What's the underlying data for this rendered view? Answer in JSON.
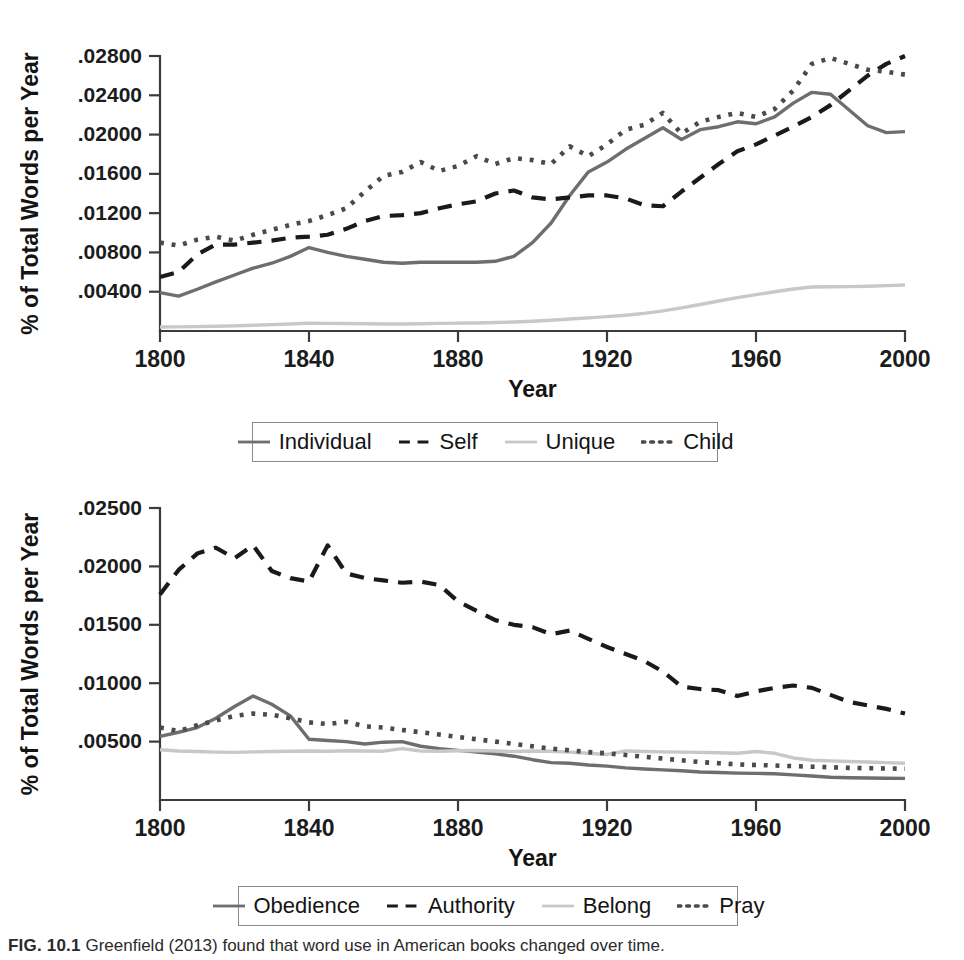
{
  "figure": {
    "caption_label": "FIG. 10.1",
    "caption_text": "Greenfield (2013) found that word use in American books changed over time."
  },
  "colors": {
    "solid_dark_gray": "#6e6e6e",
    "dashed_black": "#1a1a1a",
    "light_gray": "#c8c8c8",
    "dotted_dark": "#4a4a4a",
    "axis": "#3c3c3c"
  },
  "chart_data": [
    {
      "type": "line",
      "title": "",
      "xlabel": "Year",
      "ylabel": "% of Total Words per Year",
      "xlim": [
        1800,
        2000
      ],
      "ylim": [
        0,
        0.028
      ],
      "xticks": [
        1800,
        1840,
        1880,
        1920,
        1960,
        2000
      ],
      "xticklabels": [
        "1800",
        "1840",
        "1880",
        "1920",
        "1960",
        "2000"
      ],
      "yticks": [
        0.004,
        0.008,
        0.012,
        0.016,
        0.02,
        0.024,
        0.028
      ],
      "yticklabels": [
        ".00400",
        ".00800",
        ".01200",
        ".01600",
        ".02000",
        ".02400",
        ".02800"
      ],
      "grid": false,
      "legend_position": "below",
      "x": [
        1800,
        1805,
        1810,
        1815,
        1820,
        1825,
        1830,
        1835,
        1840,
        1845,
        1850,
        1855,
        1860,
        1865,
        1870,
        1875,
        1880,
        1885,
        1890,
        1895,
        1900,
        1905,
        1910,
        1915,
        1920,
        1925,
        1930,
        1935,
        1940,
        1945,
        1950,
        1955,
        1960,
        1965,
        1970,
        1975,
        1980,
        1985,
        1990,
        1995,
        2000
      ],
      "series": [
        {
          "name": "Individual",
          "style": "solid",
          "color": "#6e6e6e",
          "values": [
            0.0039,
            0.00355,
            0.00425,
            0.005,
            0.0057,
            0.0064,
            0.0069,
            0.0076,
            0.0085,
            0.008,
            0.0076,
            0.0073,
            0.007,
            0.0069,
            0.007,
            0.007,
            0.007,
            0.007,
            0.0071,
            0.0076,
            0.009,
            0.011,
            0.0138,
            0.0162,
            0.0172,
            0.0185,
            0.0196,
            0.0207,
            0.0195,
            0.0205,
            0.0208,
            0.0213,
            0.0211,
            0.0218,
            0.0232,
            0.0243,
            0.0241,
            0.0225,
            0.0209,
            0.0202,
            0.0203
          ]
        },
        {
          "name": "Self",
          "style": "dashed",
          "color": "#1a1a1a",
          "values": [
            0.0055,
            0.006,
            0.0078,
            0.0088,
            0.0088,
            0.009,
            0.0092,
            0.0095,
            0.0096,
            0.0098,
            0.0104,
            0.0112,
            0.0117,
            0.0118,
            0.012,
            0.0125,
            0.0129,
            0.0132,
            0.014,
            0.0143,
            0.0136,
            0.0134,
            0.0136,
            0.0138,
            0.0138,
            0.0135,
            0.0128,
            0.0127,
            0.0142,
            0.0156,
            0.017,
            0.0183,
            0.019,
            0.0199,
            0.0208,
            0.0218,
            0.023,
            0.0245,
            0.026,
            0.0272,
            0.028
          ]
        },
        {
          "name": "Unique",
          "style": "solid",
          "color": "#c8c8c8",
          "values": [
            0.0004,
            0.00042,
            0.00045,
            0.00048,
            0.00052,
            0.00058,
            0.00065,
            0.00072,
            0.0008,
            0.00078,
            0.00076,
            0.00074,
            0.00072,
            0.00072,
            0.00074,
            0.00078,
            0.0008,
            0.00082,
            0.00086,
            0.00092,
            0.001,
            0.0011,
            0.00122,
            0.00134,
            0.00146,
            0.0016,
            0.0018,
            0.00205,
            0.00235,
            0.0027,
            0.00305,
            0.0034,
            0.0037,
            0.004,
            0.00428,
            0.00448,
            0.0045,
            0.00452,
            0.00456,
            0.00462,
            0.00468
          ]
        },
        {
          "name": "Child",
          "style": "dotted",
          "color": "#4a4a4a",
          "values": [
            0.009,
            0.0087,
            0.0093,
            0.0096,
            0.0092,
            0.0098,
            0.0103,
            0.0108,
            0.0112,
            0.0118,
            0.0125,
            0.0142,
            0.0158,
            0.0162,
            0.0172,
            0.0163,
            0.0168,
            0.0178,
            0.017,
            0.0176,
            0.0174,
            0.017,
            0.0188,
            0.0178,
            0.019,
            0.0205,
            0.021,
            0.0222,
            0.0201,
            0.0213,
            0.0218,
            0.0222,
            0.0218,
            0.0226,
            0.0245,
            0.0272,
            0.0278,
            0.0272,
            0.0266,
            0.0264,
            0.0261
          ]
        }
      ]
    },
    {
      "type": "line",
      "title": "",
      "xlabel": "Year",
      "ylabel": "% of Total Words per Year",
      "xlim": [
        1800,
        2000
      ],
      "ylim": [
        0,
        0.025
      ],
      "xticks": [
        1800,
        1840,
        1880,
        1920,
        1960,
        2000
      ],
      "xticklabels": [
        "1800",
        "1840",
        "1880",
        "1920",
        "1960",
        "2000"
      ],
      "yticks": [
        0.005,
        0.01,
        0.015,
        0.02,
        0.025
      ],
      "yticklabels": [
        ".00500",
        ".01000",
        ".01500",
        ".02000",
        ".02500"
      ],
      "grid": false,
      "legend_position": "below",
      "x": [
        1800,
        1805,
        1810,
        1815,
        1820,
        1825,
        1830,
        1835,
        1840,
        1845,
        1850,
        1855,
        1860,
        1865,
        1870,
        1875,
        1880,
        1885,
        1890,
        1895,
        1900,
        1905,
        1910,
        1915,
        1920,
        1925,
        1930,
        1935,
        1940,
        1945,
        1950,
        1955,
        1960,
        1965,
        1970,
        1975,
        1980,
        1985,
        1990,
        1995,
        2000
      ],
      "series": [
        {
          "name": "Obedience",
          "style": "solid",
          "color": "#6e6e6e",
          "values": [
            0.00545,
            0.0058,
            0.0062,
            0.007,
            0.008,
            0.0089,
            0.0082,
            0.0072,
            0.0052,
            0.0051,
            0.005,
            0.0048,
            0.00495,
            0.005,
            0.0046,
            0.0044,
            0.00425,
            0.0041,
            0.00395,
            0.00375,
            0.00345,
            0.0032,
            0.00315,
            0.003,
            0.0029,
            0.00275,
            0.00265,
            0.00258,
            0.0025,
            0.0024,
            0.00235,
            0.0023,
            0.00228,
            0.00225,
            0.00215,
            0.00205,
            0.00195,
            0.0019,
            0.00188,
            0.00186,
            0.00185
          ]
        },
        {
          "name": "Authority",
          "style": "dashed",
          "color": "#1a1a1a",
          "values": [
            0.0176,
            0.0197,
            0.0211,
            0.0216,
            0.0207,
            0.0218,
            0.0196,
            0.019,
            0.0187,
            0.0218,
            0.0194,
            0.019,
            0.0188,
            0.0186,
            0.0187,
            0.0184,
            0.017,
            0.0162,
            0.0154,
            0.015,
            0.0148,
            0.0142,
            0.0145,
            0.0138,
            0.0131,
            0.0125,
            0.0119,
            0.011,
            0.0097,
            0.0095,
            0.0094,
            0.0089,
            0.0093,
            0.0096,
            0.0098,
            0.0096,
            0.009,
            0.0084,
            0.0081,
            0.0078,
            0.0074
          ]
        },
        {
          "name": "Belong",
          "style": "solid",
          "color": "#c8c8c8",
          "values": [
            0.0043,
            0.0042,
            0.00415,
            0.0041,
            0.00408,
            0.00412,
            0.00415,
            0.00418,
            0.0042,
            0.00418,
            0.00422,
            0.0042,
            0.00418,
            0.0044,
            0.0042,
            0.00418,
            0.00422,
            0.00424,
            0.0042,
            0.00415,
            0.0042,
            0.00418,
            0.0041,
            0.004,
            0.0039,
            0.0042,
            0.00415,
            0.00412,
            0.0041,
            0.00408,
            0.00405,
            0.004,
            0.00415,
            0.004,
            0.0036,
            0.0034,
            0.00335,
            0.0033,
            0.00325,
            0.0032,
            0.00315
          ]
        },
        {
          "name": "Pray",
          "style": "dotted",
          "color": "#4a4a4a",
          "values": [
            0.0062,
            0.0059,
            0.0064,
            0.0068,
            0.0072,
            0.0074,
            0.0073,
            0.007,
            0.00665,
            0.0065,
            0.0067,
            0.0063,
            0.0062,
            0.006,
            0.0058,
            0.0056,
            0.0054,
            0.0052,
            0.005,
            0.0048,
            0.0046,
            0.0044,
            0.00425,
            0.0041,
            0.004,
            0.00385,
            0.0037,
            0.00355,
            0.0034,
            0.00325,
            0.00315,
            0.00305,
            0.003,
            0.00295,
            0.0029,
            0.00285,
            0.0028,
            0.00275,
            0.00272,
            0.0027,
            0.00268
          ]
        }
      ]
    }
  ],
  "legends": [
    {
      "entries": [
        {
          "label": "Individual",
          "style": "solid",
          "color": "#6e6e6e"
        },
        {
          "label": "Self",
          "style": "dashed",
          "color": "#1a1a1a"
        },
        {
          "label": "Unique",
          "style": "solid",
          "color": "#c8c8c8"
        },
        {
          "label": "Child",
          "style": "dotted",
          "color": "#4a4a4a"
        }
      ]
    },
    {
      "entries": [
        {
          "label": "Obedience",
          "style": "solid",
          "color": "#6e6e6e"
        },
        {
          "label": "Authority",
          "style": "dashed",
          "color": "#1a1a1a"
        },
        {
          "label": "Belong",
          "style": "solid",
          "color": "#c8c8c8"
        },
        {
          "label": "Pray",
          "style": "dotted",
          "color": "#4a4a4a"
        }
      ]
    }
  ]
}
